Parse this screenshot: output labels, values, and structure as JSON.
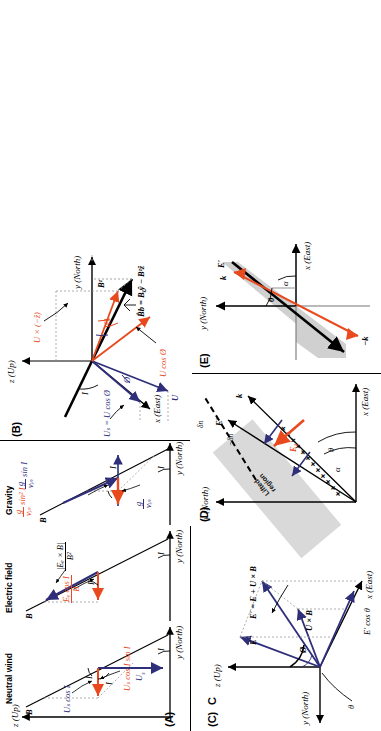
{
  "figure": {
    "caption_panels": [
      "(A)",
      "(B)",
      "(C)",
      "(D)",
      "(E)"
    ],
    "colors": {
      "blue": "#2e2e7a",
      "red": "#e8491d",
      "black": "#000000",
      "shade": "#d0d0d0"
    }
  },
  "panelA": {
    "label": "(A)",
    "subpanels": [
      {
        "title": "Neutral wind"
      },
      {
        "title": "Electric field"
      },
      {
        "title": "Gravity"
      }
    ],
    "axis_z": "z (Up)",
    "axis_y": "y (North)",
    "b_label": "B",
    "angle_I": "I",
    "neutral_wind": {
      "u_s": "U",
      "u_s_sub": "s",
      "u_s_cos_I": "Uₛ cos I",
      "u_s_cos_I_sin_I": "Uₛ cos I sin I",
      "angle_1": "I",
      "angle_2": "I",
      "angle_3": "I"
    },
    "electric_field": {
      "e_cross_b": "|Eₑ × B|",
      "e_cross_b_den": "B²",
      "e_cos_num": "Eₑ cos I",
      "e_cos_den": "B",
      "angle_1": "I",
      "angle_2": "I"
    },
    "gravity": {
      "g_num": "g",
      "g_den": "νᵢₙ",
      "g_sin_I": "sin I",
      "g_sin2_I": "sin² I",
      "angle_1": "I",
      "angle_2": "I"
    }
  },
  "panelB": {
    "label": "(B)",
    "axis_z": "z (Up)",
    "axis_y": "y (North)",
    "axis_x": "x (East)",
    "angle_I": "I",
    "angle_phi_blue": "Ø",
    "angle_phi_red": "Ø",
    "angle_phi_upper": "Ø",
    "u_label": "U",
    "us_label": "Uₛ = U cos Ø",
    "u_cos_phi": "U cos Ø",
    "u_cross_minus_z": "U × (−ẑ)",
    "b_vector": "B̂b = Bᵧŷ − Bᶻẑ",
    "bz_label": "Bᶻ"
  },
  "panelC": {
    "label": "(C)",
    "bold_c": "C",
    "axis_z": "z (Up)",
    "axis_y": "y (North)",
    "axis_x": "x (East)",
    "theta": "θ",
    "phi": "Ø",
    "e_label": "E",
    "uxb_label": "U × B",
    "estar_eq": "E′ = E + U × B",
    "estar_cos": "E′ cos θ"
  },
  "panelD": {
    "label": "(D)",
    "axis_y": "y (North)",
    "axis_x": "x (East)",
    "k_label": "k",
    "estar_label": "E′",
    "e1_label": "E₁",
    "alpha": "α",
    "theta": "θ",
    "lifted_region": "Lifted\nregion",
    "lifted_region_line1": "Lifted",
    "lifted_region_line2": "region",
    "dn_positive": "δn",
    "dn_negative": "−δn",
    "plus_row": "+ + + + + + + + + +"
  },
  "panelE": {
    "label": "(E)",
    "axis_y": "y (North)",
    "axis_x": "x (East)",
    "k_label": "k",
    "minus_k_label": "−k",
    "estar_label": "E′",
    "alpha": "α",
    "theta": "θ"
  }
}
